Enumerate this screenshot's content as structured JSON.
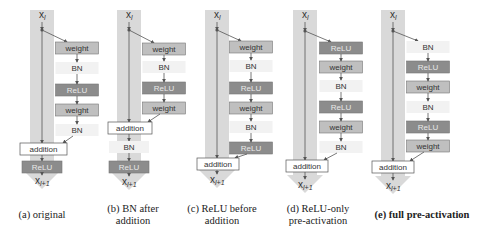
{
  "figure": {
    "colors": {
      "band": "#d9d9d9",
      "band_edge": "#c8c8c8",
      "weight_fill": "#bfbfbf",
      "relu_fill": "#8c8c8c",
      "bn_fill": "#f2f2f2",
      "addition_fill": "#ffffff",
      "stroke": "#555555",
      "text": "#333333",
      "relu_text": "#e8e8e8"
    },
    "input_label": "x",
    "input_sub": "l",
    "output_label": "x",
    "output_sub": "l+1",
    "variants": [
      {
        "id": "a",
        "caption_lines": [
          "(a) original"
        ],
        "caption_bold": false,
        "band_x": 42,
        "branch_x": 77,
        "branch_dot_y": 30,
        "nodes": [
          {
            "type": "weight",
            "label": "weight",
            "y": 48
          },
          {
            "type": "bn",
            "label": "BN",
            "y": 68
          },
          {
            "type": "relu",
            "label": "ReLU",
            "y": 90
          },
          {
            "type": "weight",
            "label": "weight",
            "y": 110
          },
          {
            "type": "bn",
            "label": "BN",
            "y": 130
          }
        ],
        "addition": {
          "label": "addition",
          "y": 149,
          "x": 20,
          "w": 47
        },
        "post": [
          {
            "type": "relu",
            "label": "ReLU",
            "y": 167
          }
        ],
        "output_y": 183
      },
      {
        "id": "b",
        "caption_lines": [
          "(b) BN after",
          "addition"
        ],
        "caption_bold": false,
        "band_x": 129,
        "branch_x": 164,
        "branch_dot_y": 30,
        "nodes": [
          {
            "type": "weight",
            "label": "weight",
            "y": 49
          },
          {
            "type": "bn",
            "label": "BN",
            "y": 67
          },
          {
            "type": "relu",
            "label": "ReLU",
            "y": 88
          },
          {
            "type": "weight",
            "label": "weight",
            "y": 108
          }
        ],
        "addition": {
          "label": "addition",
          "y": 128,
          "x": 108,
          "w": 44
        },
        "post": [
          {
            "type": "bn",
            "label": "BN",
            "y": 147
          },
          {
            "type": "relu",
            "label": "ReLU",
            "y": 167
          }
        ],
        "output_y": 184
      },
      {
        "id": "c",
        "caption_lines": [
          "(c) ReLU before",
          "addition"
        ],
        "caption_bold": false,
        "band_x": 217,
        "branch_x": 251,
        "branch_dot_y": 30,
        "nodes": [
          {
            "type": "weight",
            "label": "weight",
            "y": 47
          },
          {
            "type": "bn",
            "label": "BN",
            "y": 66
          },
          {
            "type": "relu",
            "label": "ReLU",
            "y": 88
          },
          {
            "type": "weight",
            "label": "weight",
            "y": 108
          },
          {
            "type": "bn",
            "label": "BN",
            "y": 127
          },
          {
            "type": "relu",
            "label": "ReLU",
            "y": 148
          }
        ],
        "addition": {
          "label": "addition",
          "y": 164,
          "x": 197,
          "w": 42
        },
        "post": [],
        "output_y": 182
      },
      {
        "id": "d",
        "caption_lines": [
          "(d) ReLU-only",
          "pre-activation"
        ],
        "caption_bold": false,
        "band_x": 305,
        "branch_x": 341,
        "branch_dot_y": 31,
        "nodes": [
          {
            "type": "relu",
            "label": "ReLU",
            "y": 48
          },
          {
            "type": "weight",
            "label": "weight",
            "y": 67
          },
          {
            "type": "bn",
            "label": "BN",
            "y": 86
          },
          {
            "type": "relu",
            "label": "ReLU",
            "y": 107
          },
          {
            "type": "weight",
            "label": "weight",
            "y": 127
          },
          {
            "type": "bn",
            "label": "BN",
            "y": 147
          }
        ],
        "addition": {
          "label": "addition",
          "y": 166,
          "x": 286,
          "w": 42
        },
        "post": [],
        "output_y": 187
      },
      {
        "id": "e",
        "caption_lines": [
          "(e) full pre-activation"
        ],
        "caption_bold": true,
        "band_x": 393,
        "branch_x": 428,
        "branch_dot_y": 31,
        "nodes": [
          {
            "type": "bn",
            "label": "BN",
            "y": 47
          },
          {
            "type": "relu",
            "label": "ReLU",
            "y": 67
          },
          {
            "type": "weight",
            "label": "weight",
            "y": 87
          },
          {
            "type": "bn",
            "label": "BN",
            "y": 107
          },
          {
            "type": "relu",
            "label": "ReLU",
            "y": 127
          },
          {
            "type": "weight",
            "label": "weight",
            "y": 146
          }
        ],
        "addition": {
          "label": "addition",
          "y": 167,
          "x": 372,
          "w": 42
        },
        "post": [],
        "output_y": 188
      }
    ]
  }
}
